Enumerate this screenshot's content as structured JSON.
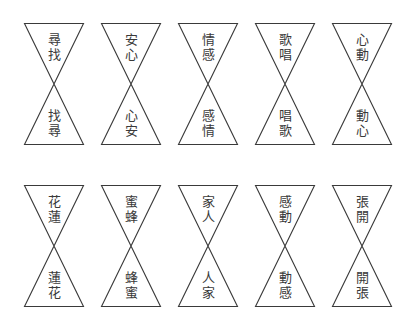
{
  "colors": {
    "line": "#3a3a3a",
    "text": "#3a3a3a",
    "background": "#ffffff"
  },
  "rows": [
    {
      "items": [
        {
          "top": [
            "尋",
            "找"
          ],
          "bottom": [
            "找",
            "尋"
          ]
        },
        {
          "top": [
            "安",
            "心"
          ],
          "bottom": [
            "心",
            "安"
          ]
        },
        {
          "top": [
            "情",
            "感"
          ],
          "bottom": [
            "感",
            "情"
          ]
        },
        {
          "top": [
            "歌",
            "唱"
          ],
          "bottom": [
            "唱",
            "歌"
          ]
        },
        {
          "top": [
            "心",
            "動"
          ],
          "bottom": [
            "動",
            "心"
          ]
        }
      ]
    },
    {
      "items": [
        {
          "top": [
            "花",
            "蓮"
          ],
          "bottom": [
            "蓮",
            "花"
          ]
        },
        {
          "top": [
            "蜜",
            "蜂"
          ],
          "bottom": [
            "蜂",
            "蜜"
          ]
        },
        {
          "top": [
            "家",
            "人"
          ],
          "bottom": [
            "人",
            "家"
          ]
        },
        {
          "top": [
            "感",
            "動"
          ],
          "bottom": [
            "動",
            "感"
          ]
        },
        {
          "top": [
            "張",
            "開"
          ],
          "bottom": [
            "開",
            "張"
          ]
        }
      ]
    }
  ]
}
